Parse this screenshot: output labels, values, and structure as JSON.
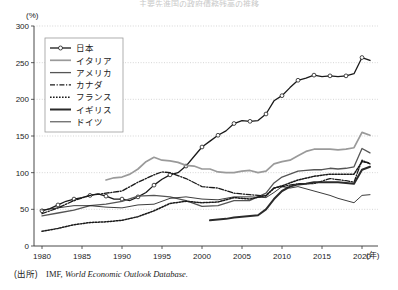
{
  "figure": {
    "title_faint": "主要先進国の政府債務残高の推移",
    "y_axis_unit": "(%)",
    "x_axis_unit": "(年)",
    "source_label": "(出所)",
    "source_text_roman": "IMF,",
    "source_text_italic": "World Economic Outlook Database."
  },
  "chart_data": {
    "type": "line",
    "title": "",
    "xlabel": "(年)",
    "ylabel": "(%)",
    "xlim": [
      1979,
      2022
    ],
    "ylim": [
      0,
      300
    ],
    "yticks": [
      0,
      50,
      100,
      150,
      200,
      250,
      300
    ],
    "xticks": [
      1980,
      1985,
      1990,
      1995,
      2000,
      2005,
      2010,
      2015,
      2020
    ],
    "grid": "horizontal-dotted",
    "legend_position": "upper-left-inside",
    "series": [
      {
        "name": "日本",
        "style": "solid-with-open-circle-markers",
        "color": "#1a1a1a",
        "x": [
          1980,
          1981,
          1982,
          1983,
          1984,
          1985,
          1986,
          1987,
          1988,
          1989,
          1990,
          1991,
          1992,
          1993,
          1994,
          1995,
          1996,
          1997,
          1998,
          1999,
          2000,
          2001,
          2002,
          2003,
          2004,
          2005,
          2006,
          2007,
          2008,
          2009,
          2010,
          2011,
          2012,
          2013,
          2014,
          2015,
          2016,
          2017,
          2018,
          2019,
          2020,
          2021
        ],
        "values": [
          48,
          51,
          56,
          61,
          64,
          66,
          69,
          71,
          68,
          64,
          64,
          62,
          67,
          73,
          83,
          91,
          97,
          100,
          109,
          122,
          135,
          143,
          151,
          157,
          167,
          171,
          170,
          171,
          180,
          198,
          205,
          216,
          226,
          229,
          233,
          231,
          232,
          231,
          232,
          235,
          257,
          253
        ]
      },
      {
        "name": "イタリア",
        "style": "solid-medium-gray",
        "color": "#9a9a9a",
        "x": [
          1988,
          1989,
          1990,
          1991,
          1992,
          1993,
          1994,
          1995,
          1996,
          1997,
          1998,
          1999,
          2000,
          2001,
          2002,
          2003,
          2004,
          2005,
          2006,
          2007,
          2008,
          2009,
          2010,
          2011,
          2012,
          2013,
          2014,
          2015,
          2016,
          2017,
          2018,
          2019,
          2020,
          2021
        ],
        "values": [
          90,
          93,
          94,
          98,
          105,
          115,
          121,
          117,
          116,
          114,
          110,
          109,
          105,
          105,
          101,
          100,
          100,
          102,
          103,
          100,
          102,
          112,
          115,
          117,
          123,
          129,
          132,
          132,
          132,
          131,
          132,
          134,
          155,
          151
        ]
      },
      {
        "name": "アメリカ",
        "style": "solid-dark-medium",
        "color": "#555555",
        "x": [
          1980,
          1982,
          1984,
          1986,
          1988,
          1990,
          1992,
          1994,
          1996,
          1998,
          2000,
          2002,
          2004,
          2006,
          2008,
          2009,
          2010,
          2011,
          2012,
          2013,
          2014,
          2015,
          2016,
          2017,
          2018,
          2019,
          2020,
          2021
        ],
        "values": [
          41,
          45,
          49,
          55,
          57,
          61,
          68,
          69,
          67,
          62,
          54,
          55,
          62,
          62,
          72,
          86,
          94,
          98,
          102,
          103,
          104,
          104,
          106,
          105,
          106,
          108,
          133,
          127
        ]
      },
      {
        "name": "カナダ",
        "style": "dash-dot",
        "color": "#1a1a1a",
        "x": [
          1980,
          1982,
          1984,
          1986,
          1988,
          1990,
          1992,
          1994,
          1995,
          1996,
          1998,
          2000,
          2002,
          2004,
          2006,
          2008,
          2009,
          2010,
          2012,
          2014,
          2016,
          2018,
          2019,
          2020,
          2021
        ],
        "values": [
          44,
          52,
          62,
          69,
          72,
          75,
          87,
          97,
          101,
          100,
          92,
          81,
          79,
          72,
          70,
          68,
          79,
          81,
          85,
          85,
          92,
          89,
          87,
          117,
          112
        ]
      },
      {
        "name": "フランス",
        "style": "dotted",
        "color": "#1a1a1a",
        "x": [
          1980,
          1982,
          1984,
          1986,
          1988,
          1990,
          1992,
          1994,
          1996,
          1998,
          2000,
          2002,
          2004,
          2006,
          2008,
          2009,
          2010,
          2012,
          2014,
          2016,
          2018,
          2019,
          2020,
          2021
        ],
        "values": [
          20,
          24,
          29,
          32,
          33,
          35,
          40,
          48,
          58,
          61,
          59,
          60,
          66,
          64,
          69,
          79,
          82,
          90,
          95,
          98,
          98,
          98,
          115,
          113
        ]
      },
      {
        "name": "イギリス",
        "style": "solid-thick",
        "color": "#2a2a2a",
        "x": [
          2001,
          2002,
          2003,
          2004,
          2005,
          2006,
          2007,
          2008,
          2009,
          2010,
          2011,
          2012,
          2013,
          2014,
          2015,
          2016,
          2017,
          2018,
          2019,
          2020,
          2021
        ],
        "values": [
          35,
          36,
          37,
          39,
          40,
          41,
          42,
          50,
          64,
          75,
          81,
          84,
          85,
          87,
          87,
          87,
          87,
          86,
          85,
          104,
          108
        ]
      },
      {
        "name": "ドイツ",
        "style": "solid-thin",
        "color": "#1a1a1a",
        "x": [
          1980,
          1982,
          1984,
          1986,
          1988,
          1990,
          1992,
          1994,
          1996,
          1998,
          2000,
          2002,
          2004,
          2006,
          2008,
          2009,
          2010,
          2011,
          2012,
          2013,
          2014,
          2015,
          2016,
          2017,
          2018,
          2019,
          2020,
          2021
        ],
        "values": [
          49,
          52,
          55,
          55,
          53,
          52,
          56,
          57,
          65,
          67,
          64,
          63,
          67,
          67,
          66,
          73,
          81,
          79,
          81,
          78,
          75,
          72,
          69,
          65,
          62,
          59,
          69,
          70
        ]
      }
    ]
  },
  "legend": {
    "items": [
      {
        "label": "日本",
        "style": "marker"
      },
      {
        "label": "イタリア",
        "style": "gray"
      },
      {
        "label": "アメリカ",
        "style": "darkgray"
      },
      {
        "label": "カナダ",
        "style": "dashdot"
      },
      {
        "label": "フランス",
        "style": "dotted"
      },
      {
        "label": "イギリス",
        "style": "thick"
      },
      {
        "label": "ドイツ",
        "style": "thin"
      }
    ]
  }
}
